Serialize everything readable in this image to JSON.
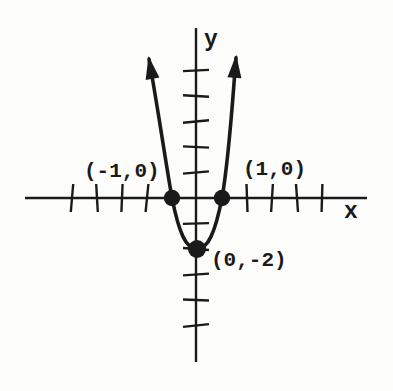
{
  "figure": {
    "axis_labels": {
      "x_label": "x",
      "y_label": "y"
    },
    "point_labels": {
      "left_intercept": "(-1,0)",
      "right_intercept": "(1,0)",
      "vertex": "(0,-2)"
    },
    "colors": {
      "ink": "#1a1a1a",
      "paper": "#fdfdfc"
    }
  },
  "chart_data": {
    "type": "line",
    "title": "",
    "xlabel": "x",
    "ylabel": "y",
    "curve_shape": "upward-opening parabola with arrowheads on both ends",
    "marked_points": [
      {
        "x": -1,
        "y": 0,
        "label": "(-1,0)"
      },
      {
        "x": 1,
        "y": 0,
        "label": "(1,0)"
      },
      {
        "x": 0,
        "y": -2,
        "label": "(0,-2)"
      }
    ],
    "x_intercepts": [
      [
        -1,
        0
      ],
      [
        1,
        0
      ]
    ],
    "vertex": [
      0,
      -2
    ],
    "curve_draw_range": [
      [
        -1.92,
        5.45
      ],
      [
        1.56,
        5.5
      ]
    ],
    "x_ticks": [
      -5,
      -4,
      -3,
      -2,
      2,
      3,
      4,
      5
    ],
    "y_ticks": [
      -5,
      -4,
      -3,
      -2,
      -1,
      1,
      2,
      3,
      4,
      5
    ],
    "xlim": [
      -6.9,
      6.8
    ],
    "ylim": [
      -7.6,
      6.7
    ],
    "grid": false,
    "axis_arrows": false,
    "curve_arrows": true
  }
}
